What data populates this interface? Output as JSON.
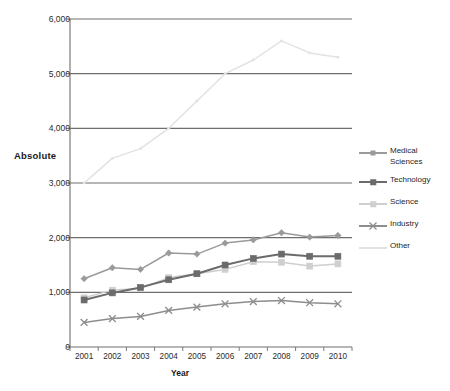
{
  "chart_data": {
    "type": "line",
    "title": "",
    "xlabel": "Year",
    "ylabel": "Absolute",
    "categories": [
      "2001",
      "2002",
      "2003",
      "2004",
      "2005",
      "2006",
      "2007",
      "2008",
      "2009",
      "2010"
    ],
    "ylim": [
      0,
      6000
    ],
    "ytick_labels": [
      "0",
      "1,000",
      "2,000",
      "3,000",
      "4,000",
      "5,000",
      "6,000"
    ],
    "ytick_values": [
      0,
      1000,
      2000,
      3000,
      4000,
      5000,
      6000
    ],
    "grid": "horizontal",
    "legend_position": "right",
    "series": [
      {
        "name": "Medical Sciences",
        "color": "#9a9a9a",
        "marker": "diamond",
        "values": [
          1250,
          1450,
          1420,
          1720,
          1700,
          1900,
          1960,
          2090,
          2010,
          2040
        ]
      },
      {
        "name": "Technology",
        "color": "#6b6b6b",
        "marker": "square",
        "values": [
          860,
          990,
          1090,
          1230,
          1340,
          1500,
          1620,
          1700,
          1660,
          1660
        ]
      },
      {
        "name": "Science",
        "color": "#cfcfcf",
        "marker": "square",
        "values": [
          900,
          1040,
          1070,
          1270,
          1340,
          1420,
          1560,
          1550,
          1480,
          1520
        ]
      },
      {
        "name": "Industry",
        "color": "#8d8d8d",
        "marker": "x",
        "values": [
          450,
          520,
          560,
          670,
          730,
          790,
          830,
          850,
          810,
          790
        ]
      },
      {
        "name": "Other",
        "color": "#e2e2e2",
        "marker": "none",
        "values": [
          3000,
          3450,
          3630,
          4000,
          4500,
          5000,
          5250,
          5600,
          5380,
          5300
        ]
      }
    ]
  },
  "axes": {
    "y_label": "Absolute",
    "x_label": "Year"
  },
  "colors": {
    "gridline": "#6e6e6e",
    "axis": "#7a7a7a",
    "text": "#1a1a1a",
    "background": "#ffffff"
  }
}
